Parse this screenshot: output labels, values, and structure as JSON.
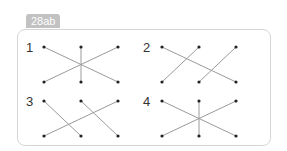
{
  "badge": {
    "label": "28ab"
  },
  "panels": [
    {
      "label": "1",
      "lines": [
        [
          "t0",
          "b2"
        ],
        [
          "t2",
          "b0"
        ],
        [
          "t1",
          "b1"
        ]
      ]
    },
    {
      "label": "2",
      "lines": [
        [
          "t0",
          "b2"
        ],
        [
          "t1",
          "b0"
        ],
        [
          "t2",
          "b1"
        ]
      ]
    },
    {
      "label": "3",
      "lines": [
        [
          "t0",
          "b1"
        ],
        [
          "t1",
          "b2"
        ],
        [
          "t2",
          "b0"
        ]
      ]
    },
    {
      "label": "4",
      "lines": [
        [
          "t0",
          "b2"
        ],
        [
          "t2",
          "b0"
        ],
        [
          "t1",
          "b1"
        ]
      ]
    }
  ],
  "colors": {
    "line": "#9a9a9a",
    "dot": "#222222",
    "badge": "#c2c2c2",
    "border": "#d6d6d6"
  }
}
